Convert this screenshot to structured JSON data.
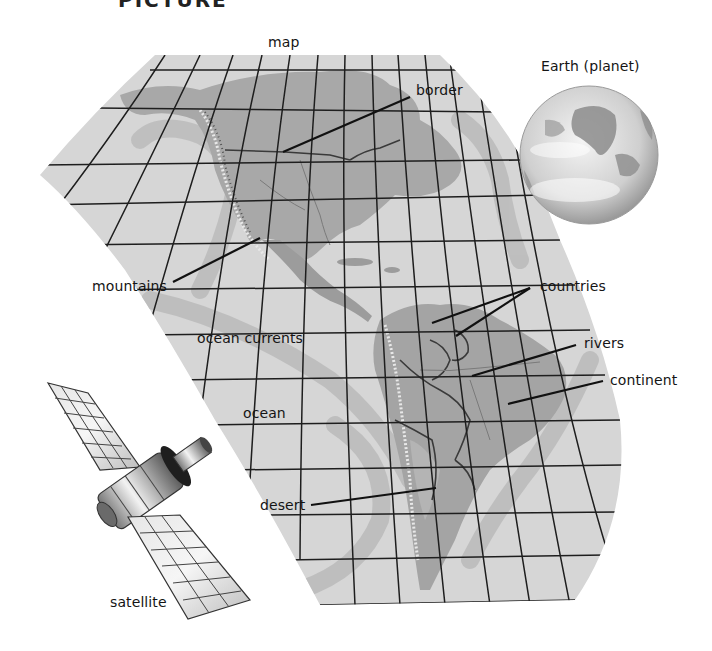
{
  "title": {
    "text": "PICTURE",
    "note": "cut off at top edge"
  },
  "diagram": {
    "labels": {
      "map": "map",
      "earth": "Earth (planet)",
      "border": "border",
      "mountains": "mountains",
      "ocean_currents": "ocean currents",
      "countries": "countries",
      "rivers": "rivers",
      "continent": "continent",
      "ocean": "ocean",
      "desert": "desert",
      "satellite": "satellite"
    },
    "colors": {
      "background": "#ffffff",
      "ocean": "#d4d4d4",
      "land": "#a6a6a6",
      "land_dark": "#8e8e8e",
      "current": "#b8b8b8",
      "grid": "#1e1e1e",
      "leader_line": "#111111",
      "earth_light": "#eeeeee",
      "earth_dark": "#8a8a8a"
    }
  }
}
